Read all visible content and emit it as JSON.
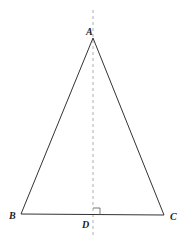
{
  "diagram": {
    "type": "isosceles-triangle-with-altitude",
    "points": {
      "A": {
        "label": "A",
        "x": 93,
        "y": 38
      },
      "B": {
        "label": "B",
        "x": 21,
        "y": 214
      },
      "C": {
        "label": "C",
        "x": 164,
        "y": 215
      },
      "D": {
        "label": "D",
        "x": 93,
        "y": 215
      }
    },
    "segments": [
      "AB",
      "AC",
      "BC"
    ],
    "axis": {
      "style": "dashed",
      "x": 93,
      "y_start": 10,
      "y_end": 238
    },
    "right_angle_marker": {
      "at": "D",
      "size": 7
    },
    "colors": {
      "stroke": "#333333",
      "axis": "#999999",
      "label": "#222222"
    }
  }
}
